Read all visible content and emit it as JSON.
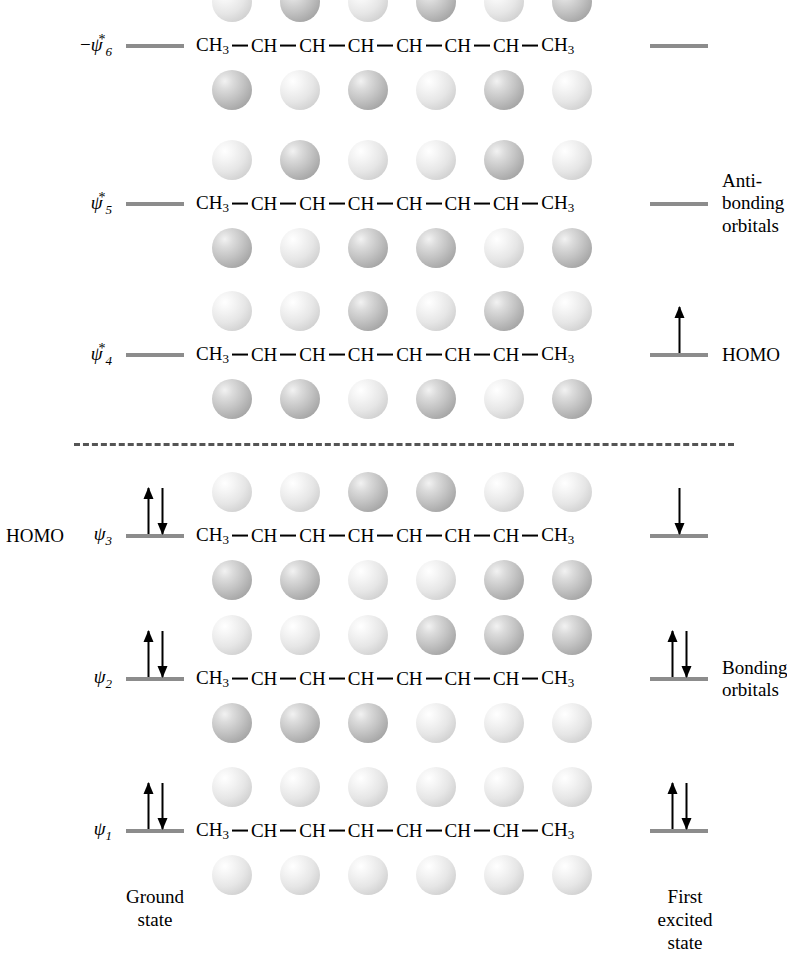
{
  "diagram": {
    "molecule_units": [
      "CH3",
      "CH",
      "CH",
      "CH",
      "CH",
      "CH",
      "CH",
      "CH3"
    ],
    "divider": {
      "style": "dashed",
      "color": "#555555"
    },
    "annotations": {
      "antibonding": "Anti-\nbonding\norbitals",
      "bonding": "Bonding\norbitals",
      "homo_left": "HOMO",
      "homo_right": "HOMO"
    },
    "state_captions": {
      "ground": "Ground\nstate",
      "excited": "First excited\nstate"
    },
    "levels": [
      {
        "id": "psi6",
        "label_prefix": "−",
        "label_symbol": "ψ",
        "label_sub": "6",
        "label_star": "*",
        "y": 46,
        "ground_electrons": [],
        "excited_electrons": [],
        "lobe_phases_top": [
          "light",
          "dark",
          "light",
          "dark",
          "light",
          "dark"
        ],
        "lobe_phases_bottom": [
          "dark",
          "light",
          "dark",
          "light",
          "dark",
          "light"
        ]
      },
      {
        "id": "psi5",
        "label_prefix": "",
        "label_symbol": "ψ",
        "label_sub": "5",
        "label_star": "*",
        "y": 204,
        "ground_electrons": [],
        "excited_electrons": [],
        "side_note_right": "antibonding",
        "lobe_phases_top": [
          "light",
          "dark",
          "light",
          "light",
          "dark",
          "light"
        ],
        "lobe_phases_bottom": [
          "dark",
          "light",
          "dark",
          "dark",
          "light",
          "dark"
        ]
      },
      {
        "id": "psi4",
        "label_prefix": "",
        "label_symbol": "ψ",
        "label_sub": "4",
        "label_star": "*",
        "y": 355,
        "ground_electrons": [],
        "excited_electrons": [
          "up"
        ],
        "side_note_right": "homo_right",
        "lobe_phases_top": [
          "light",
          "light",
          "dark",
          "light",
          "dark",
          "light"
        ],
        "lobe_phases_bottom": [
          "dark",
          "dark",
          "light",
          "dark",
          "light",
          "dark"
        ]
      },
      {
        "id": "psi3",
        "label_prefix": "",
        "label_symbol": "ψ",
        "label_sub": "3",
        "label_star": "",
        "y": 536,
        "ground_electrons": [
          "up",
          "down"
        ],
        "excited_electrons": [
          "down"
        ],
        "side_note_left": "homo_left",
        "lobe_phases_top": [
          "light",
          "light",
          "dark",
          "dark",
          "light",
          "light"
        ],
        "lobe_phases_bottom": [
          "dark",
          "dark",
          "light",
          "light",
          "dark",
          "dark"
        ]
      },
      {
        "id": "psi2",
        "label_prefix": "",
        "label_symbol": "ψ",
        "label_sub": "2",
        "label_star": "",
        "y": 679,
        "ground_electrons": [
          "up",
          "down"
        ],
        "excited_electrons": [
          "up",
          "down"
        ],
        "side_note_right": "bonding",
        "lobe_phases_top": [
          "light",
          "light",
          "light",
          "dark",
          "dark",
          "dark"
        ],
        "lobe_phases_bottom": [
          "dark",
          "dark",
          "dark",
          "light",
          "light",
          "light"
        ]
      },
      {
        "id": "psi1",
        "label_prefix": "",
        "label_symbol": "ψ",
        "label_sub": "1",
        "label_star": "",
        "y": 831,
        "ground_electrons": [
          "up",
          "down"
        ],
        "excited_electrons": [
          "up",
          "down"
        ],
        "lobe_phases_top": [
          "light",
          "light",
          "light",
          "light",
          "light",
          "light"
        ],
        "lobe_phases_bottom": [
          "light",
          "light",
          "light",
          "light",
          "light",
          "light"
        ]
      }
    ]
  },
  "chart_data": {
    "type": "diagram",
    "ylabel": "Energy",
    "levels": [
      "ψ1",
      "ψ2",
      "ψ3",
      "ψ4*",
      "ψ5*",
      "ψ6*"
    ],
    "level_y_px": [
      831,
      679,
      536,
      355,
      204,
      46
    ],
    "ground_state_occupancy": [
      2,
      2,
      2,
      0,
      0,
      0
    ],
    "excited_state_occupancy": [
      2,
      2,
      1,
      1,
      0,
      0
    ],
    "homo_ground": "ψ3",
    "homo_excited": "ψ4*",
    "bonding_levels": [
      "ψ1",
      "ψ2",
      "ψ3"
    ],
    "antibonding_levels": [
      "ψ4*",
      "ψ5*",
      "ψ6*"
    ],
    "nodes_per_level": [
      0,
      1,
      2,
      3,
      4,
      5
    ],
    "columns": [
      "Ground state",
      "First excited state"
    ],
    "legend": [
      "Bonding orbitals",
      "Anti-bonding orbitals",
      "HOMO"
    ]
  }
}
